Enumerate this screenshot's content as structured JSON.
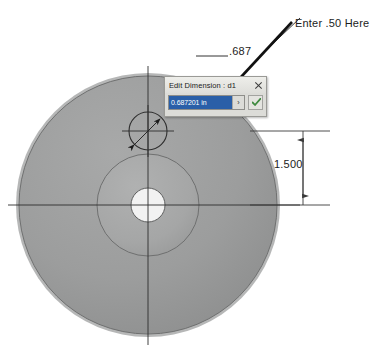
{
  "drawing": {
    "description": "CAD sketch of a circular flange part with dimensions",
    "annotation_note": "Enter .50 Here",
    "dimensions": [
      {
        "name": "hole-diameter",
        "value": ".687"
      },
      {
        "name": "bolt-circle-height",
        "value": "1.500"
      }
    ],
    "colors": {
      "body_gray": "#9a9b9b",
      "hub_gray": "#a7a8a8",
      "rim_light": "#b4b5b5",
      "center_hole": "#f2f2f2",
      "line": "#3a3a3a",
      "accent_select": "#2a5fa8",
      "check_green": "#3f8a3f"
    }
  },
  "dialog": {
    "title": "Edit Dimension : d1",
    "value": "0.687201 in",
    "spinner_glyph": "›",
    "close_label": "Close",
    "accept_label": "OK"
  }
}
